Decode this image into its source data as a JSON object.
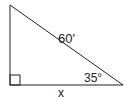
{
  "diagram": {
    "type": "right-triangle",
    "vertices": {
      "top_left": [
        10,
        5
      ],
      "bottom_left": [
        10,
        85
      ],
      "bottom_right": [
        123,
        85
      ]
    },
    "labels": {
      "hypotenuse": "60'",
      "angle": "35°",
      "base": "x"
    },
    "right_angle_marker": true,
    "stroke_color": "#222222"
  }
}
